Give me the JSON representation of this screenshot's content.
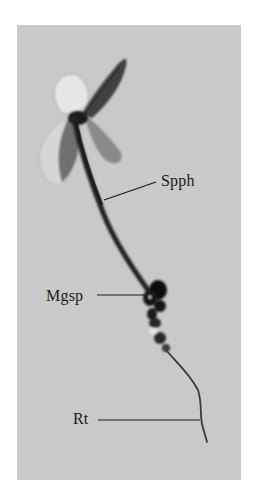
{
  "figure": {
    "background_color": "#c9c9c9",
    "labels": [
      {
        "id": "spph",
        "text": "Spph"
      },
      {
        "id": "mgsp",
        "text": "Mgsp"
      },
      {
        "id": "rt",
        "text": "Rt"
      }
    ]
  }
}
